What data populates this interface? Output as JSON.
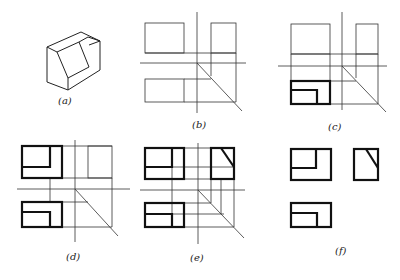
{
  "figure": {
    "panels": [
      {
        "id": "a",
        "label": "(a)",
        "content": "isometric view of notched block"
      },
      {
        "id": "b",
        "label": "(b)",
        "content": "projection framework with miter line"
      },
      {
        "id": "c",
        "label": "(c)",
        "content": "top view drawn"
      },
      {
        "id": "d",
        "label": "(d)",
        "content": "front view drawn"
      },
      {
        "id": "e",
        "label": "(e)",
        "content": "side view derived via projection lines"
      },
      {
        "id": "f",
        "label": "(f)",
        "content": "finished three views"
      }
    ]
  },
  "colors": {
    "line": "#222222",
    "background": "#ffffff"
  }
}
